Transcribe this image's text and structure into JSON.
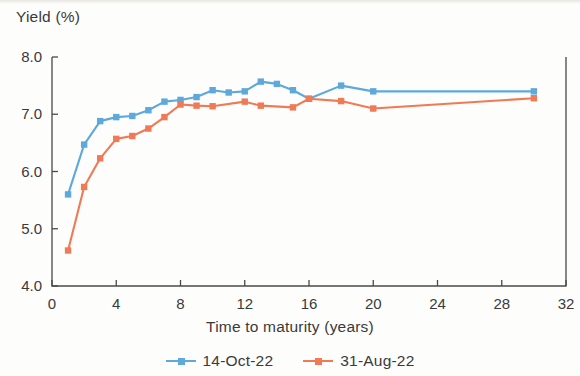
{
  "chart_data": {
    "type": "line",
    "title": "",
    "subtitle": "",
    "ylabel": "Yield (%)",
    "xlabel": "Time to maturity (years)",
    "xlim": [
      0,
      32
    ],
    "ylim": [
      4.0,
      8.0
    ],
    "xticks": [
      0,
      4,
      8,
      12,
      16,
      20,
      24,
      28,
      32
    ],
    "xtick_labels": [
      "0",
      "4",
      "8",
      "12",
      "16",
      "20",
      "24",
      "28",
      "32"
    ],
    "yticks": [
      4.0,
      5.0,
      6.0,
      7.0,
      8.0
    ],
    "ytick_labels": [
      "4.0",
      "5.0",
      "6.0",
      "7.0",
      "8.0"
    ],
    "grid": false,
    "legend_position": "bottom",
    "series": [
      {
        "name": "14-Oct-22",
        "color": "#5DA9DC",
        "marker": "square",
        "x": [
          1,
          2,
          3,
          4,
          5,
          6,
          7,
          8,
          9,
          10,
          11,
          12,
          13,
          14,
          15,
          16,
          18,
          20,
          30
        ],
        "values": [
          5.6,
          6.47,
          6.88,
          6.95,
          6.97,
          7.07,
          7.22,
          7.25,
          7.3,
          7.42,
          7.38,
          7.4,
          7.57,
          7.53,
          7.42,
          7.27,
          7.5,
          7.4,
          7.4
        ]
      },
      {
        "name": "31-Aug-22",
        "color": "#EF7A55",
        "marker": "square",
        "x": [
          1,
          2,
          3,
          4,
          5,
          6,
          7,
          8,
          9,
          10,
          12,
          13,
          15,
          16,
          18,
          20,
          30
        ],
        "values": [
          4.62,
          5.73,
          6.23,
          6.57,
          6.62,
          6.75,
          6.95,
          7.17,
          7.15,
          7.14,
          7.22,
          7.15,
          7.12,
          7.27,
          7.23,
          7.1,
          7.28
        ]
      }
    ]
  },
  "legend": {
    "items": [
      {
        "label": "14-Oct-22",
        "color": "#5DA9DC"
      },
      {
        "label": "31-Aug-22",
        "color": "#EF7A55"
      }
    ]
  },
  "axis": {
    "y_title": "Yield (%)",
    "x_title": "Time to maturity (years)"
  },
  "colors": {
    "series_blue": "#5DA9DC",
    "series_orange": "#EF7A55",
    "axis": "#4a4a48",
    "text": "#3a3a3a",
    "background": "#fdfdfc"
  }
}
